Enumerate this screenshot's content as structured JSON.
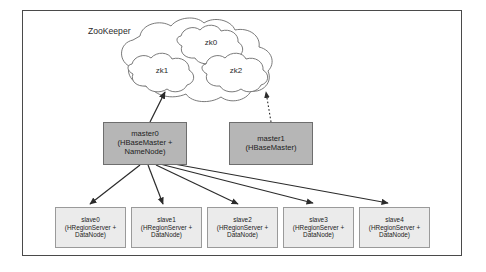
{
  "diagram": {
    "frame": {
      "border_color": "#4a4a4a"
    },
    "zookeeper": {
      "label": "ZooKeeper",
      "nodes": [
        {
          "id": "zk0",
          "label": "zk0"
        },
        {
          "id": "zk1",
          "label": "zk1"
        },
        {
          "id": "zk2",
          "label": "zk2"
        }
      ]
    },
    "masters": [
      {
        "id": "master0",
        "title": "master0",
        "subtitle": "(HBaseMaster +",
        "subtitle2": "NameNode)",
        "fill": "#b6b6b6",
        "link_to": "zk1",
        "link_style": "solid"
      },
      {
        "id": "master1",
        "title": "master1",
        "subtitle": "(HBaseMaster)",
        "subtitle2": "",
        "fill": "#b6b6b6",
        "link_to": "zk2",
        "link_style": "dotted"
      }
    ],
    "slaves": [
      {
        "id": "slave0",
        "title": "slave0",
        "subtitle": "(HRegionServer +",
        "subtitle2": "DataNode)"
      },
      {
        "id": "slave1",
        "title": "slave1",
        "subtitle": "(HRegionServer +",
        "subtitle2": "DataNode)"
      },
      {
        "id": "slave2",
        "title": "slave2",
        "subtitle": "(HRegionServer +",
        "subtitle2": "DataNode)"
      },
      {
        "id": "slave3",
        "title": "slave3",
        "subtitle": "(HRegionServer +",
        "subtitle2": "DataNode)"
      },
      {
        "id": "slave4",
        "title": "slave4",
        "subtitle": "(HRegionServer +",
        "subtitle2": "DataNode)"
      }
    ],
    "colors": {
      "master_fill": "#b6b6b6",
      "slave_fill": "#ebebeb",
      "stroke": "#3a3a3a",
      "cloud_stroke": "#6b6b6b"
    }
  }
}
